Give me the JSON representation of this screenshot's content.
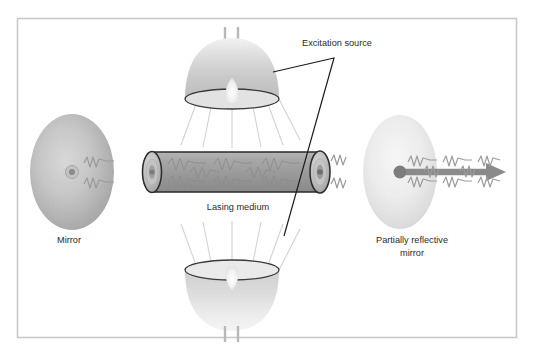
{
  "figure": {
    "kind": "laser-schematic-diagram",
    "title_visible": false,
    "background_color": "#ffffff",
    "frame": {
      "name": "diagram-border",
      "color": "#c9c9c9",
      "x": 17,
      "y": 18,
      "width": 500,
      "height": 320
    }
  },
  "labels": {
    "excitation_source": "Excitation source",
    "lasing_medium": "Lasing medium",
    "mirror": "Mirror",
    "partially_reflective_line1": "Partially reflective",
    "partially_reflective_line2": "mirror"
  },
  "components": [
    {
      "id": "mirror-left",
      "name": "mirror-left",
      "label": "Mirror",
      "shape": "ellipse",
      "cx": 72,
      "cy": 172,
      "rx": 42,
      "ry": 58,
      "fill_center": "#cfcfcf",
      "fill_edge": "#ababab",
      "reflectivity": "full"
    },
    {
      "id": "mirror-right",
      "name": "mirror-partially-reflective",
      "label": "Partially reflective mirror",
      "shape": "ellipse",
      "cx": 400,
      "cy": 172,
      "rx": 37,
      "ry": 57,
      "fill_center": "#f1f1f1",
      "fill_edge": "#d8d8d8",
      "reflectivity": "partial"
    },
    {
      "id": "lasing-medium",
      "name": "lasing-medium-tube",
      "label": "Lasing medium",
      "shape": "cylinder",
      "x1": 143,
      "x2": 325,
      "cy": 172,
      "half_height": 20,
      "fill": "#9a9a9a",
      "stroke": "#2b2b2b"
    },
    {
      "id": "lamp-top",
      "name": "excitation-lamp-top",
      "label": "Excitation source",
      "shape": "dome-lamp",
      "cx": 232,
      "rim_y": 99,
      "apex_y": 36,
      "rim_rx": 47,
      "rim_ry": 10,
      "orientation": "down",
      "pins": 2
    },
    {
      "id": "lamp-bottom",
      "name": "excitation-lamp-bottom",
      "label": "Excitation source",
      "shape": "dome-lamp",
      "cx": 232,
      "rim_y": 270,
      "apex_y": 333,
      "rim_rx": 47,
      "rim_ry": 10,
      "orientation": "up",
      "pins": 2
    },
    {
      "id": "output-beam",
      "name": "output-laser-beam-arrow",
      "shape": "arrow",
      "x_start": 400,
      "x_end": 506,
      "y": 172,
      "color": "#8a8a8a",
      "direction": "right"
    }
  ],
  "leader_lines": [
    {
      "name": "excitation-source-leader",
      "points": "273,72 334,58 284,236",
      "color": "#1c1c1c"
    }
  ],
  "colors": {
    "ink": "#2b2b2b",
    "tube_fill": "#9a9a9a",
    "tube_stroke": "#2b2b2b",
    "beam": "#8a8a8a",
    "mirror_left": "#b9b9b9",
    "mirror_right": "#e9e9e9",
    "lamp_body": "#d4d4d4",
    "ray": "#cfcfcf",
    "border": "#c9c9c9"
  },
  "label_positions": {
    "excitation_source": {
      "x": 337,
      "y": 46
    },
    "lasing_medium": {
      "x": 238,
      "y": 210
    },
    "mirror": {
      "x": 69,
      "y": 243
    },
    "partially_reflective_1": {
      "x": 412,
      "y": 243
    },
    "partially_reflective_2": {
      "x": 412,
      "y": 256
    }
  }
}
